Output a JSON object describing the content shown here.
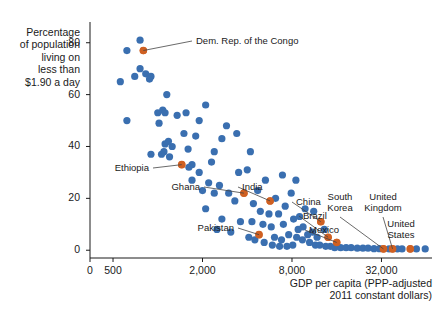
{
  "chart_data": {
    "type": "scatter",
    "title": "",
    "ylabel": "Percentage of population living on less than $1.90 a day",
    "ylabel_lines": [
      "Percentage",
      "of population",
      "living on",
      "less than",
      "$1.90 a day"
    ],
    "xlabel": "GDP per capita (PPP-adjusted 2011 constant dollars)",
    "xlabel_lines": [
      "GDP per capita (PPP-adjusted",
      "2011 constant dollars)"
    ],
    "xscale": "log",
    "xticks": [
      0,
      500,
      2000,
      8000,
      32000
    ],
    "xtick_labels": [
      "0",
      "500",
      "2,000",
      "8,000",
      "32,000"
    ],
    "yticks": [
      0,
      20,
      40,
      60,
      80
    ],
    "ytick_labels": [
      "0",
      "20",
      "40",
      "60",
      "80"
    ],
    "xlim": [
      350,
      70000
    ],
    "ylim": [
      -3,
      88
    ],
    "grid": false,
    "legend": null,
    "colors": {
      "default_point": "#3a6fb0",
      "highlight_point": "#cf6022",
      "axis": "#1a1a1a",
      "text": "#1a1a1a",
      "background": "#ffffff"
    },
    "highlight_labels": [
      {
        "name": "Dem. Rep. of the Congo",
        "x": 800,
        "y": 77,
        "label_x": 196,
        "label_y": 41,
        "anchor": "start"
      },
      {
        "name": "Ethiopia",
        "x": 1450,
        "y": 33,
        "label_x": 149,
        "label_y": 168,
        "anchor": "end"
      },
      {
        "name": "Ghana",
        "x": 3800,
        "y": 22,
        "label_x": 200,
        "label_y": 187,
        "anchor": "end"
      },
      {
        "name": "India",
        "x": 5700,
        "y": 19,
        "label_x": 242,
        "label_y": 187,
        "anchor": "start"
      },
      {
        "name": "Pakistan",
        "x": 4800,
        "y": 6,
        "label_x": 234,
        "label_y": 228,
        "anchor": "end"
      },
      {
        "name": "China",
        "x": 12500,
        "y": 11,
        "label_x": 296,
        "label_y": 202,
        "anchor": "start"
      },
      {
        "name": "Brazil",
        "x": 14000,
        "y": 5,
        "label_x": 303,
        "label_y": 216,
        "anchor": "start"
      },
      {
        "name": "Mexico",
        "x": 16000,
        "y": 3,
        "label_x": 309,
        "label_y": 230,
        "anchor": "start"
      },
      {
        "name": "South Korea",
        "x": 33000,
        "y": 0.5,
        "label_x": 340,
        "label_y": 197,
        "anchor": "middle"
      },
      {
        "name": "United Kingdom",
        "x": 38000,
        "y": 0.5,
        "label_x": 383,
        "label_y": 197,
        "anchor": "middle"
      },
      {
        "name": "United States",
        "x": 50000,
        "y": 0.5,
        "label_x": 401,
        "label_y": 224,
        "anchor": "middle"
      }
    ],
    "points": [
      {
        "x": 760,
        "y": 81,
        "h": 0
      },
      {
        "x": 620,
        "y": 77,
        "h": 0
      },
      {
        "x": 800,
        "y": 77,
        "h": 1
      },
      {
        "x": 760,
        "y": 70,
        "h": 0
      },
      {
        "x": 700,
        "y": 67,
        "h": 0
      },
      {
        "x": 560,
        "y": 65,
        "h": 0
      },
      {
        "x": 830,
        "y": 68,
        "h": 0
      },
      {
        "x": 880,
        "y": 66,
        "h": 0
      },
      {
        "x": 900,
        "y": 67,
        "h": 0
      },
      {
        "x": 620,
        "y": 50,
        "h": 0
      },
      {
        "x": 1150,
        "y": 60,
        "h": 0
      },
      {
        "x": 1000,
        "y": 53,
        "h": 0
      },
      {
        "x": 1080,
        "y": 54,
        "h": 0
      },
      {
        "x": 1120,
        "y": 53,
        "h": 0
      },
      {
        "x": 1020,
        "y": 49,
        "h": 0
      },
      {
        "x": 1550,
        "y": 53,
        "h": 0
      },
      {
        "x": 2100,
        "y": 56,
        "h": 0
      },
      {
        "x": 1500,
        "y": 45,
        "h": 0
      },
      {
        "x": 1800,
        "y": 44,
        "h": 0
      },
      {
        "x": 2700,
        "y": 43,
        "h": 0
      },
      {
        "x": 4200,
        "y": 38,
        "h": 0
      },
      {
        "x": 1250,
        "y": 40,
        "h": 0
      },
      {
        "x": 1120,
        "y": 41,
        "h": 0
      },
      {
        "x": 1180,
        "y": 42,
        "h": 0
      },
      {
        "x": 1100,
        "y": 38,
        "h": 0
      },
      {
        "x": 1060,
        "y": 37,
        "h": 0
      },
      {
        "x": 1200,
        "y": 36,
        "h": 0
      },
      {
        "x": 900,
        "y": 37,
        "h": 0
      },
      {
        "x": 1600,
        "y": 39,
        "h": 0
      },
      {
        "x": 2400,
        "y": 38,
        "h": 0
      },
      {
        "x": 1700,
        "y": 33,
        "h": 0
      },
      {
        "x": 1900,
        "y": 30,
        "h": 0
      },
      {
        "x": 1450,
        "y": 33,
        "h": 1
      },
      {
        "x": 1620,
        "y": 32,
        "h": 0
      },
      {
        "x": 1700,
        "y": 27,
        "h": 0
      },
      {
        "x": 2200,
        "y": 26,
        "h": 0
      },
      {
        "x": 2600,
        "y": 25,
        "h": 0
      },
      {
        "x": 2000,
        "y": 23,
        "h": 0
      },
      {
        "x": 2400,
        "y": 22,
        "h": 0
      },
      {
        "x": 3000,
        "y": 22,
        "h": 0
      },
      {
        "x": 3800,
        "y": 22,
        "h": 1
      },
      {
        "x": 4700,
        "y": 23,
        "h": 0
      },
      {
        "x": 5700,
        "y": 19,
        "h": 1
      },
      {
        "x": 3300,
        "y": 19,
        "h": 0
      },
      {
        "x": 4400,
        "y": 18,
        "h": 0
      },
      {
        "x": 6200,
        "y": 20,
        "h": 0
      },
      {
        "x": 7200,
        "y": 17,
        "h": 0
      },
      {
        "x": 4900,
        "y": 15,
        "h": 0
      },
      {
        "x": 5600,
        "y": 14,
        "h": 0
      },
      {
        "x": 6500,
        "y": 14,
        "h": 0
      },
      {
        "x": 2700,
        "y": 12,
        "h": 0
      },
      {
        "x": 3600,
        "y": 11,
        "h": 0
      },
      {
        "x": 4300,
        "y": 11,
        "h": 0
      },
      {
        "x": 5100,
        "y": 10,
        "h": 0
      },
      {
        "x": 5800,
        "y": 9,
        "h": 0
      },
      {
        "x": 7000,
        "y": 10,
        "h": 0
      },
      {
        "x": 8200,
        "y": 12,
        "h": 0
      },
      {
        "x": 9000,
        "y": 13,
        "h": 0
      },
      {
        "x": 9500,
        "y": 9,
        "h": 0
      },
      {
        "x": 8800,
        "y": 8,
        "h": 0
      },
      {
        "x": 4800,
        "y": 6,
        "h": 1
      },
      {
        "x": 4100,
        "y": 5,
        "h": 0
      },
      {
        "x": 4500,
        "y": 4,
        "h": 0
      },
      {
        "x": 5200,
        "y": 3,
        "h": 0
      },
      {
        "x": 5900,
        "y": 2,
        "h": 0
      },
      {
        "x": 6600,
        "y": 1.5,
        "h": 0
      },
      {
        "x": 7400,
        "y": 1.5,
        "h": 0
      },
      {
        "x": 8100,
        "y": 2,
        "h": 0
      },
      {
        "x": 6100,
        "y": 5,
        "h": 0
      },
      {
        "x": 6800,
        "y": 4,
        "h": 0
      },
      {
        "x": 7600,
        "y": 6,
        "h": 0
      },
      {
        "x": 8600,
        "y": 5,
        "h": 0
      },
      {
        "x": 9400,
        "y": 4,
        "h": 0
      },
      {
        "x": 10200,
        "y": 6,
        "h": 0
      },
      {
        "x": 11000,
        "y": 7,
        "h": 0
      },
      {
        "x": 11800,
        "y": 5,
        "h": 0
      },
      {
        "x": 12500,
        "y": 11,
        "h": 1
      },
      {
        "x": 13200,
        "y": 8,
        "h": 0
      },
      {
        "x": 14000,
        "y": 5,
        "h": 1
      },
      {
        "x": 16000,
        "y": 3,
        "h": 1
      },
      {
        "x": 10500,
        "y": 3,
        "h": 0
      },
      {
        "x": 11500,
        "y": 2,
        "h": 0
      },
      {
        "x": 12300,
        "y": 2,
        "h": 0
      },
      {
        "x": 13500,
        "y": 1.5,
        "h": 0
      },
      {
        "x": 14500,
        "y": 1.5,
        "h": 0
      },
      {
        "x": 15500,
        "y": 1,
        "h": 0
      },
      {
        "x": 17000,
        "y": 1,
        "h": 0
      },
      {
        "x": 18500,
        "y": 1,
        "h": 0
      },
      {
        "x": 20000,
        "y": 1,
        "h": 0
      },
      {
        "x": 22000,
        "y": 0.8,
        "h": 0
      },
      {
        "x": 24000,
        "y": 0.8,
        "h": 0
      },
      {
        "x": 26000,
        "y": 0.8,
        "h": 0
      },
      {
        "x": 28500,
        "y": 0.6,
        "h": 0
      },
      {
        "x": 31000,
        "y": 0.6,
        "h": 0
      },
      {
        "x": 33000,
        "y": 0.5,
        "h": 1
      },
      {
        "x": 36000,
        "y": 0.5,
        "h": 0
      },
      {
        "x": 38000,
        "y": 0.5,
        "h": 1
      },
      {
        "x": 41000,
        "y": 0.5,
        "h": 0
      },
      {
        "x": 44000,
        "y": 0.5,
        "h": 0
      },
      {
        "x": 50000,
        "y": 0.5,
        "h": 1
      },
      {
        "x": 55000,
        "y": 0.5,
        "h": 0
      },
      {
        "x": 63000,
        "y": 0.5,
        "h": 0
      },
      {
        "x": 2900,
        "y": 48,
        "h": 0
      },
      {
        "x": 3500,
        "y": 30,
        "h": 0
      },
      {
        "x": 2100,
        "y": 16,
        "h": 0
      },
      {
        "x": 2500,
        "y": 8,
        "h": 0
      },
      {
        "x": 3100,
        "y": 7,
        "h": 0
      },
      {
        "x": 9800,
        "y": 16,
        "h": 0
      },
      {
        "x": 11200,
        "y": 15,
        "h": 0
      },
      {
        "x": 7900,
        "y": 22,
        "h": 0
      },
      {
        "x": 5300,
        "y": 27,
        "h": 0
      },
      {
        "x": 1350,
        "y": 52,
        "h": 0
      },
      {
        "x": 1900,
        "y": 50,
        "h": 0
      },
      {
        "x": 2300,
        "y": 34,
        "h": 0
      },
      {
        "x": 3400,
        "y": 45,
        "h": 0
      },
      {
        "x": 4000,
        "y": 31,
        "h": 0
      },
      {
        "x": 6900,
        "y": 29,
        "h": 0
      },
      {
        "x": 8500,
        "y": 27,
        "h": 0
      }
    ]
  }
}
